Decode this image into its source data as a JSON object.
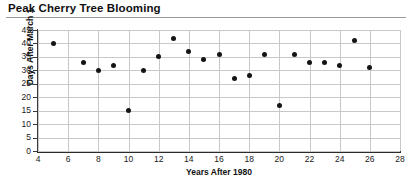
{
  "chart_data": {
    "type": "scatter",
    "title": "Peak Cherry Tree Blooming",
    "xlabel": "Years After 1980",
    "ylabel": "Days After March 1",
    "xlim": [
      4,
      28
    ],
    "ylim": [
      0,
      45
    ],
    "xticks": [
      4,
      6,
      8,
      10,
      12,
      14,
      16,
      18,
      20,
      22,
      24,
      26,
      28
    ],
    "yticks": [
      0,
      5,
      10,
      15,
      20,
      25,
      30,
      35,
      40,
      45
    ],
    "grid": true,
    "legend": null,
    "x": [
      5,
      7,
      8,
      9,
      10,
      11,
      12,
      13,
      14,
      15,
      16,
      17,
      18,
      19,
      20,
      21,
      22,
      23,
      24,
      25,
      26
    ],
    "y": [
      40,
      33,
      30,
      32,
      15,
      30,
      35,
      42,
      37,
      34,
      36,
      27,
      28,
      36,
      17,
      36,
      33,
      33,
      32,
      41,
      31
    ],
    "points": [
      {
        "x": 5,
        "y": 40
      },
      {
        "x": 7,
        "y": 33
      },
      {
        "x": 8,
        "y": 30
      },
      {
        "x": 9,
        "y": 32
      },
      {
        "x": 10,
        "y": 15
      },
      {
        "x": 11,
        "y": 30
      },
      {
        "x": 12,
        "y": 35
      },
      {
        "x": 13,
        "y": 42
      },
      {
        "x": 14,
        "y": 37
      },
      {
        "x": 15,
        "y": 34
      },
      {
        "x": 16,
        "y": 36
      },
      {
        "x": 17,
        "y": 27
      },
      {
        "x": 18,
        "y": 28
      },
      {
        "x": 19,
        "y": 36
      },
      {
        "x": 20,
        "y": 17
      },
      {
        "x": 21,
        "y": 36
      },
      {
        "x": 22,
        "y": 33
      },
      {
        "x": 23,
        "y": 33
      },
      {
        "x": 24,
        "y": 32
      },
      {
        "x": 25,
        "y": 41
      },
      {
        "x": 26,
        "y": 31
      }
    ],
    "marker_color": "#141414",
    "grid_color": "#c8c8c8",
    "axis_color": "#2b2b2b"
  }
}
